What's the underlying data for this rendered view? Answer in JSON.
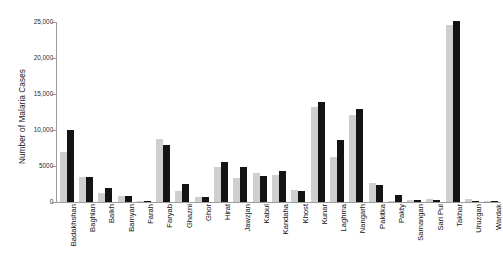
{
  "chart_data": {
    "type": "bar",
    "title": "",
    "subtitle": "",
    "xlabel": "",
    "ylabel": "Number of Malaria Cases",
    "ylim": [
      0,
      25000
    ],
    "yticks": [
      0,
      5000,
      10000,
      15000,
      20000,
      25000
    ],
    "ytick_labels": [
      "0",
      "5000",
      "10,000",
      "15,000",
      "20,000",
      "25,000"
    ],
    "grid": false,
    "legend": "none",
    "legend_position": "none",
    "colors": {
      "series_1": "#cfcfcf",
      "series_2": "#141414",
      "axis": "#9b9b9b",
      "text": "#111111",
      "background": "#ffffff"
    },
    "categories": [
      "Badakhshan",
      "Baghlan",
      "Balkh",
      "Bamyan",
      "Farah",
      "Faryab",
      "Ghazni",
      "Ghor",
      "Hirat",
      "Jawzjan",
      "Kabul",
      "Kandaha",
      "Khost",
      "Kunar",
      "Laghma",
      "Nangarh",
      "Pakitka",
      "Pakty",
      "Samangan",
      "Sari Pul",
      "Takhar",
      "Uruzgan",
      "Wardak"
    ],
    "series": [
      {
        "name": "series_1",
        "color": "#cfcfcf",
        "values": [
          6900,
          3500,
          1200,
          900,
          200,
          8800,
          1500,
          700,
          4900,
          3400,
          4000,
          3800,
          1700,
          13200,
          6300,
          12100,
          2600,
          150,
          250,
          350,
          24600,
          450,
          120
        ]
      },
      {
        "name": "series_2",
        "color": "#141414",
        "values": [
          10000,
          3500,
          1950,
          800,
          150,
          7900,
          2450,
          700,
          5500,
          4900,
          3600,
          4250,
          1550,
          13900,
          8600,
          12950,
          2300,
          950,
          300,
          250,
          25100,
          180,
          90
        ]
      }
    ]
  }
}
